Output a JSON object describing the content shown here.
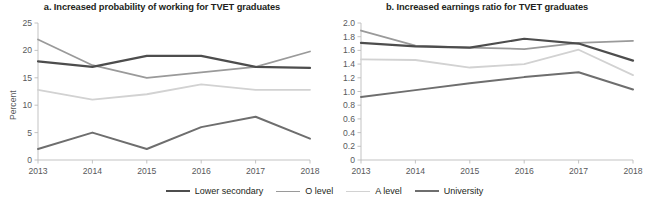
{
  "figure": {
    "width": 649,
    "height": 202,
    "background": "#ffffff"
  },
  "legend": {
    "position": "bottom-center",
    "entries": [
      {
        "label": "Lower secondary",
        "color": "#4d4d4d",
        "width": 2.2
      },
      {
        "label": "O level",
        "color": "#9a9a9a",
        "width": 1.8
      },
      {
        "label": "A level",
        "color": "#d2d2d2",
        "width": 1.8
      },
      {
        "label": "University",
        "color": "#6e6e6e",
        "width": 2.0
      }
    ]
  },
  "chart_data": [
    {
      "id": "panel-a",
      "type": "line",
      "title": "a. Increased probability of working for TVET graduates",
      "xlabel": "",
      "ylabel": "Percent",
      "categories": [
        "2013",
        "2014",
        "2015",
        "2016",
        "2017",
        "2018"
      ],
      "x": [
        2013,
        2014,
        2015,
        2016,
        2017,
        2018
      ],
      "ylim": [
        0,
        25
      ],
      "yticks": [
        0,
        5,
        10,
        15,
        20,
        25
      ],
      "ytick_labels": [
        "0",
        "5",
        "10",
        "15",
        "20",
        "25"
      ],
      "grid": false,
      "series": [
        {
          "name": "Lower secondary",
          "color": "#4d4d4d",
          "width": 2.2,
          "values": [
            18.0,
            17.0,
            19.0,
            19.0,
            17.0,
            16.8
          ]
        },
        {
          "name": "O level",
          "color": "#9a9a9a",
          "width": 1.8,
          "values": [
            22.0,
            17.3,
            15.0,
            16.0,
            17.0,
            19.8
          ]
        },
        {
          "name": "A level",
          "color": "#d2d2d2",
          "width": 1.8,
          "values": [
            12.8,
            11.0,
            12.0,
            13.8,
            12.8,
            12.8
          ]
        },
        {
          "name": "University",
          "color": "#6e6e6e",
          "width": 2.0,
          "values": [
            2.0,
            5.0,
            2.0,
            6.0,
            7.9,
            3.9
          ]
        }
      ]
    },
    {
      "id": "panel-b",
      "type": "line",
      "title": "b. Increased earnings ratio for TVET graduates",
      "xlabel": "",
      "ylabel": "Ratio",
      "categories": [
        "2013",
        "2014",
        "2015",
        "2016",
        "2017",
        "2018"
      ],
      "x": [
        2013,
        2014,
        2015,
        2016,
        2017,
        2018
      ],
      "ylim": [
        0,
        2.0
      ],
      "yticks": [
        0,
        0.2,
        0.4,
        0.6,
        0.8,
        1.0,
        1.2,
        1.4,
        1.6,
        1.8,
        2.0
      ],
      "ytick_labels": [
        "0",
        "0.2",
        "0.4",
        "0.6",
        "0.8",
        "1.0",
        "1.2",
        "1.4",
        "1.6",
        "1.8",
        "2.0"
      ],
      "grid": false,
      "series": [
        {
          "name": "Lower secondary",
          "color": "#4d4d4d",
          "width": 2.2,
          "values": [
            1.71,
            1.66,
            1.64,
            1.77,
            1.7,
            1.45
          ]
        },
        {
          "name": "O level",
          "color": "#9a9a9a",
          "width": 1.8,
          "values": [
            1.89,
            1.67,
            1.64,
            1.62,
            1.71,
            1.74
          ]
        },
        {
          "name": "A level",
          "color": "#d2d2d2",
          "width": 1.8,
          "values": [
            1.47,
            1.46,
            1.35,
            1.4,
            1.61,
            1.24
          ]
        },
        {
          "name": "University",
          "color": "#6e6e6e",
          "width": 2.0,
          "values": [
            0.92,
            1.02,
            1.12,
            1.21,
            1.28,
            1.03
          ]
        }
      ]
    }
  ]
}
